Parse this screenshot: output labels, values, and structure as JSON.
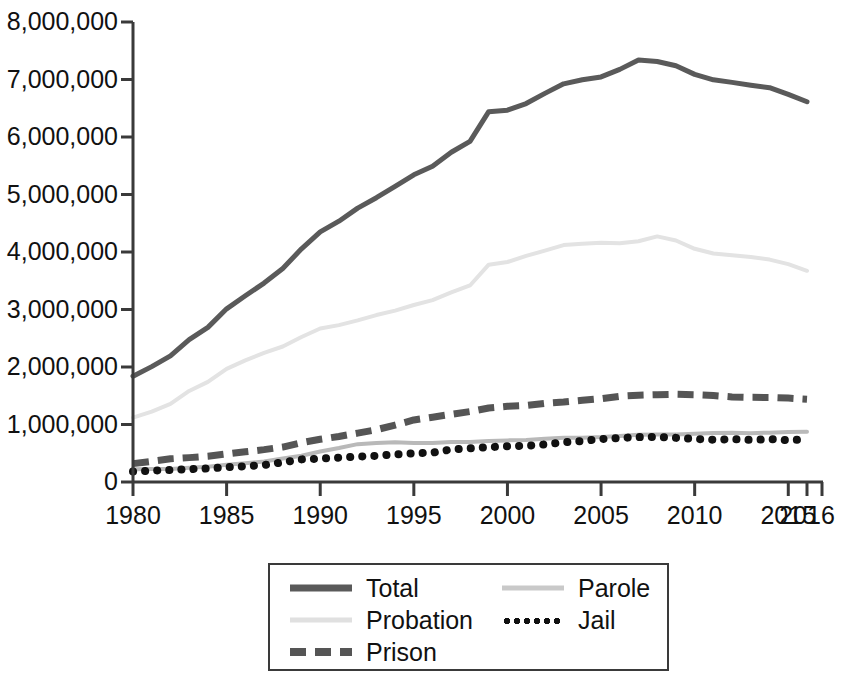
{
  "chart_data": {
    "type": "line",
    "title": "",
    "xlabel": "",
    "ylabel": "",
    "xlim": [
      1980,
      2016
    ],
    "ylim": [
      0,
      8000000
    ],
    "grid": false,
    "legend_position": "bottom-center",
    "y_ticks": [
      0,
      1000000,
      2000000,
      3000000,
      4000000,
      5000000,
      6000000,
      7000000,
      8000000
    ],
    "y_tick_labels": [
      "0",
      "1,000,000",
      "2,000,000",
      "3,000,000",
      "4,000,000",
      "5,000,000",
      "6,000,000",
      "7,000,000",
      "8,000,000"
    ],
    "x_ticks": [
      1980,
      1985,
      1990,
      1995,
      2000,
      2005,
      2010,
      2015,
      2016
    ],
    "x_tick_labels": [
      "1980",
      "1985",
      "1990",
      "1995",
      "2000",
      "2005",
      "2010",
      "2015",
      "2016"
    ],
    "x": [
      1980,
      1981,
      1982,
      1983,
      1984,
      1985,
      1986,
      1987,
      1988,
      1989,
      1990,
      1991,
      1992,
      1993,
      1994,
      1995,
      1996,
      1997,
      1998,
      1999,
      2000,
      2001,
      2002,
      2003,
      2004,
      2005,
      2006,
      2007,
      2008,
      2009,
      2010,
      2011,
      2012,
      2013,
      2014,
      2015,
      2016
    ],
    "series": [
      {
        "name": "Total",
        "style": "solid",
        "color": "#5a5a5a",
        "width": 5,
        "values": [
          1840400,
          2006600,
          2192600,
          2475100,
          2689200,
          3011500,
          3239400,
          3459600,
          3714100,
          4055300,
          4350300,
          4535600,
          4762600,
          4944000,
          5141300,
          5342900,
          5490700,
          5734900,
          5925100,
          6440800,
          6467200,
          6581700,
          6758800,
          6924500,
          6995000,
          7045100,
          7176000,
          7339600,
          7312600,
          7239100,
          7089000,
          6994500,
          6949800,
          6899700,
          6856900,
          6741400,
          6613500
        ]
      },
      {
        "name": "Probation",
        "style": "solid",
        "color": "#e3e3e3",
        "width": 4,
        "values": [
          1118100,
          1225100,
          1357300,
          1582900,
          1740900,
          1968700,
          2114600,
          2247200,
          2356500,
          2522100,
          2670200,
          2728500,
          2811600,
          2903100,
          2981000,
          3077900,
          3164000,
          3296500,
          3417600,
          3779900,
          3826200,
          3931700,
          4024000,
          4120000,
          4143500,
          4162500,
          4151900,
          4186000,
          4270900,
          4199800,
          4055500,
          3973800,
          3942800,
          3912900,
          3868400,
          3789800,
          3673100
        ]
      },
      {
        "name": "Prison",
        "style": "dashed",
        "color": "#555555",
        "width": 7,
        "values": [
          319600,
          360000,
          402900,
          423900,
          448300,
          487600,
          526400,
          562800,
          607800,
          683400,
          743400,
          792500,
          850600,
          909400,
          990100,
          1078500,
          1127500,
          1176600,
          1224500,
          1287200,
          1316300,
          1330000,
          1367900,
          1390300,
          1421300,
          1448800,
          1491200,
          1509500,
          1518600,
          1524500,
          1518100,
          1504200,
          1480200,
          1471800,
          1471300,
          1458700,
          1439800
        ]
      },
      {
        "name": "Parole",
        "style": "solid",
        "color": "#b9b9b9",
        "width": 4,
        "values": [
          220400,
          225500,
          224600,
          246400,
          266900,
          300200,
          325600,
          355500,
          407900,
          456800,
          531400,
          590400,
          658600,
          676100,
          690400,
          679400,
          679700,
          694800,
          696400,
          714500,
          723900,
          732300,
          750900,
          769900,
          771300,
          780600,
          798200,
          821500,
          828200,
          824100,
          840700,
          853900,
          858400,
          849500,
          857700,
          870500,
          874800
        ]
      },
      {
        "name": "Jail",
        "style": "dotted",
        "color": "#111111",
        "width": 8,
        "values": [
          182300,
          196800,
          209600,
          223600,
          234500,
          256600,
          274400,
          295900,
          341900,
          393300,
          405300,
          424100,
          441800,
          455500,
          479700,
          499300,
          510400,
          567100,
          584400,
          605900,
          621100,
          631200,
          652000,
          691300,
          713900,
          747500,
          765800,
          780200,
          785500,
          767400,
          748700,
          735600,
          744500,
          731200,
          744600,
          728200,
          740700
        ]
      }
    ]
  },
  "legend": {
    "entries": [
      {
        "label": "Total",
        "style": "solid",
        "color": "#5a5a5a",
        "thickness": 7
      },
      {
        "label": "Probation",
        "style": "solid",
        "color": "#e0e0e0",
        "thickness": 5
      },
      {
        "label": "Prison",
        "style": "dashed",
        "color": "#555555",
        "thickness": 8
      },
      {
        "label": "Parole",
        "style": "solid",
        "color": "#c9c9c9",
        "thickness": 5
      },
      {
        "label": "Jail",
        "style": "dotted",
        "color": "#111111",
        "thickness": 8
      }
    ]
  },
  "axes": {
    "axis_color": "#3a3a3a"
  }
}
